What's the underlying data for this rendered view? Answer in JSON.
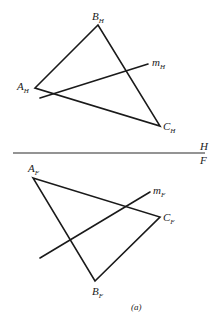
{
  "diagram": {
    "caption": "(a)",
    "fold_line": {
      "upper_label": "H",
      "lower_label": "F",
      "y": 153,
      "x1": 13,
      "x2": 205
    },
    "top_view": {
      "vertices": {
        "A": {
          "label": "A",
          "sub": "H",
          "x": 35,
          "y": 88
        },
        "B": {
          "label": "B",
          "sub": "H",
          "x": 98,
          "y": 25
        },
        "C": {
          "label": "C",
          "sub": "H",
          "x": 160,
          "y": 126
        }
      },
      "line_m": {
        "label": "m",
        "sub": "H",
        "x1": 40,
        "y1": 98,
        "x2": 148,
        "y2": 64
      }
    },
    "front_view": {
      "vertices": {
        "A": {
          "label": "A",
          "sub": "F",
          "x": 33,
          "y": 178
        },
        "B": {
          "label": "B",
          "sub": "F",
          "x": 95,
          "y": 281
        },
        "C": {
          "label": "C",
          "sub": "F",
          "x": 160,
          "y": 217
        }
      },
      "line_m": {
        "label": "m",
        "sub": "F",
        "x1": 40,
        "y1": 258,
        "x2": 150,
        "y2": 192
      }
    }
  }
}
